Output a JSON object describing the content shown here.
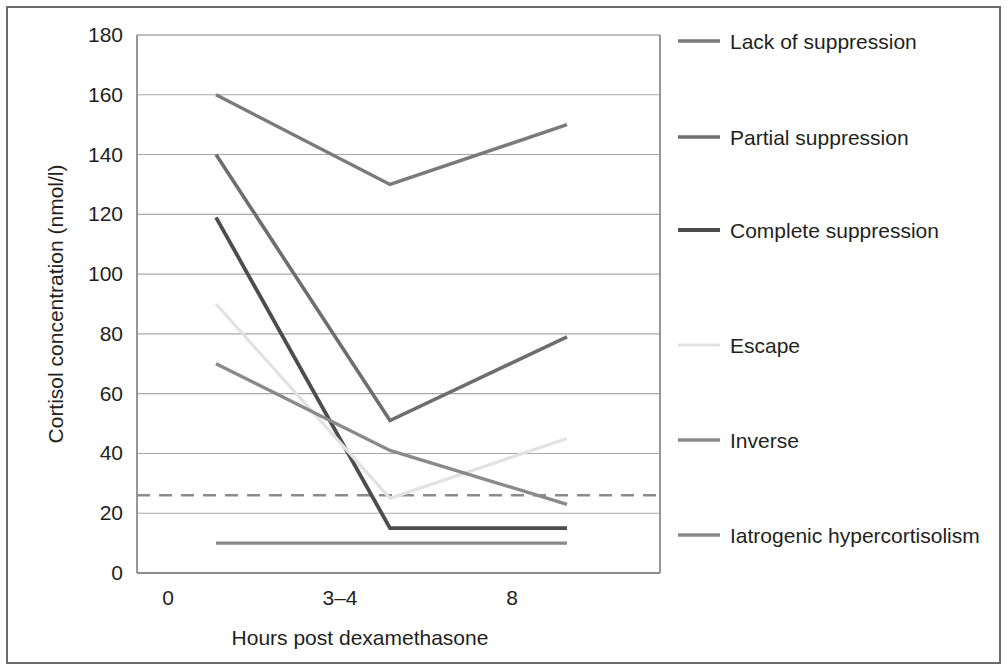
{
  "chart_data": {
    "type": "line",
    "title": "",
    "xlabel": "Hours post dexamethasone",
    "ylabel": "Cortisol concentration (nmol/l)",
    "x": [
      0,
      "3-4",
      8
    ],
    "xticklabels": [
      "0",
      "3–4",
      "8"
    ],
    "yticklabels": [
      "0",
      "20",
      "40",
      "60",
      "80",
      "100",
      "120",
      "140",
      "160",
      "180"
    ],
    "yticks": [
      0,
      20,
      40,
      60,
      80,
      100,
      120,
      140,
      160,
      180
    ],
    "ylim": [
      0,
      180
    ],
    "grid": "horizontal",
    "legend_position": "right",
    "reference_line": {
      "label": "",
      "value": 26,
      "style": "dashed",
      "color": "#8c8c8c"
    },
    "series": [
      {
        "name": "Lack of suppression",
        "values": [
          160,
          130,
          150
        ],
        "color": "#7a7a7a",
        "width": 3.4
      },
      {
        "name": "Partial suppression",
        "values": [
          140,
          51,
          79
        ],
        "color": "#6e6e6e",
        "width": 3.6
      },
      {
        "name": "Complete suppression",
        "values": [
          119,
          15,
          15
        ],
        "color": "#4d4d4d",
        "width": 3.8
      },
      {
        "name": "Escape",
        "values": [
          90,
          25,
          45
        ],
        "color": "#e2e2e2",
        "width": 3.2
      },
      {
        "name": "Inverse",
        "values": [
          70,
          41,
          23
        ],
        "color": "#8a8a8a",
        "width": 3.4
      },
      {
        "name": "Iatrogenic hypercortisolism",
        "values": [
          10,
          10,
          10
        ],
        "color": "#8a8a8a",
        "width": 3.4
      }
    ]
  },
  "legend": {
    "items": [
      {
        "label": "Lack of suppression",
        "color": "#7a7a7a",
        "width": 3.4
      },
      {
        "label": "Partial suppression",
        "color": "#6e6e6e",
        "width": 3.6
      },
      {
        "label": "Complete suppression",
        "color": "#4d4d4d",
        "width": 3.8
      },
      {
        "label": "Escape",
        "color": "#e2e2e2",
        "width": 3.2
      },
      {
        "label": "Inverse",
        "color": "#8a8a8a",
        "width": 3.4
      },
      {
        "label": "Iatrogenic hypercortisolism",
        "color": "#8a8a8a",
        "width": 3.4
      }
    ]
  },
  "colors": {
    "frame": "#6b6b6b",
    "axis": "#8c8c8c",
    "grid": "#a8a8a8",
    "text": "#231f20",
    "background": "#ffffff"
  }
}
